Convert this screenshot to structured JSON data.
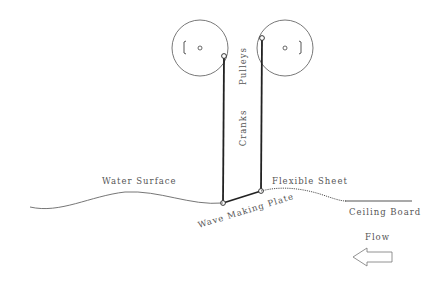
{
  "diagram": {
    "labels": {
      "pulleys": "Pulleys",
      "cranks": "Cranks",
      "water_surface": "Water Surface",
      "flexible_sheet": "Flexible Sheet",
      "wave_making_plate": "Wave Making Plate",
      "ceiling_board": "Ceiling Board",
      "flow": "Flow"
    },
    "icons": {
      "pulley_left": "pulley-wheel",
      "pulley_right": "pulley-wheel",
      "flow_arrow": "arrow-left-outline"
    },
    "colors": {
      "line": "#444444",
      "thick_line": "#222222",
      "text": "#555555",
      "background": "#ffffff"
    }
  }
}
